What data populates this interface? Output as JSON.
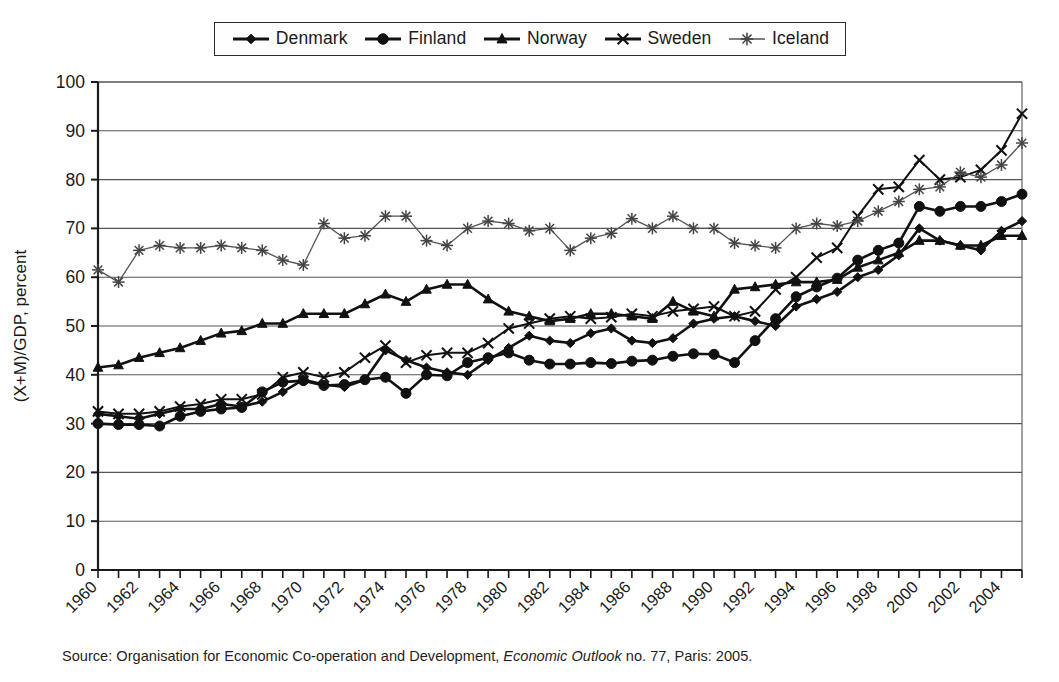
{
  "chart_data": {
    "type": "line",
    "title": "",
    "xlabel": "",
    "ylabel": "(X+M)/GDP, percent",
    "ylim": [
      0,
      100
    ],
    "ytick_step": 10,
    "yticks": [
      0,
      10,
      20,
      30,
      40,
      50,
      60,
      70,
      80,
      90,
      100
    ],
    "xlim": [
      1960,
      2005
    ],
    "xticks": [
      1960,
      1962,
      1964,
      1966,
      1968,
      1970,
      1972,
      1974,
      1976,
      1978,
      1980,
      1982,
      1984,
      1986,
      1988,
      1990,
      1992,
      1994,
      1996,
      1998,
      2000,
      2002,
      2004
    ],
    "xtick_labels": [
      "1960",
      "1962",
      "1964",
      "1966",
      "1968",
      "1970",
      "1972",
      "1974",
      "1976",
      "1978",
      "1980",
      "1982",
      "1984",
      "1986",
      "1988",
      "1990",
      "1992",
      "1994",
      "1996",
      "1998",
      "2000",
      "2002",
      "2004"
    ],
    "x": [
      1960,
      1961,
      1962,
      1963,
      1964,
      1965,
      1966,
      1967,
      1968,
      1969,
      1970,
      1971,
      1972,
      1973,
      1974,
      1975,
      1976,
      1977,
      1978,
      1979,
      1980,
      1981,
      1982,
      1983,
      1984,
      1985,
      1986,
      1987,
      1988,
      1989,
      1990,
      1991,
      1992,
      1993,
      1994,
      1995,
      1996,
      1997,
      1998,
      1999,
      2000,
      2001,
      2002,
      2003,
      2004,
      2005
    ],
    "grid": "horizontal",
    "legend_position": "top",
    "series": [
      {
        "name": "Denmark",
        "marker": "diamond",
        "values": [
          32.0,
          31.5,
          31.0,
          32.0,
          33.0,
          33.0,
          34.0,
          33.5,
          34.5,
          36.5,
          39.0,
          38.0,
          37.5,
          39.0,
          45.0,
          43.0,
          41.5,
          40.5,
          40.0,
          43.0,
          45.5,
          48.0,
          47.0,
          46.5,
          48.5,
          49.5,
          47.0,
          46.5,
          47.5,
          50.5,
          51.5,
          52.0,
          51.0,
          50.0,
          54.0,
          55.5,
          57.0,
          60.0,
          61.5,
          64.5,
          70.0,
          67.5,
          66.5,
          65.5,
          69.5,
          71.5
        ]
      },
      {
        "name": "Finland",
        "marker": "circle",
        "values": [
          30.0,
          29.8,
          29.8,
          29.5,
          31.5,
          32.5,
          33.0,
          33.3,
          36.5,
          38.5,
          38.8,
          37.8,
          38.0,
          39.0,
          39.5,
          36.2,
          40.0,
          39.8,
          42.5,
          43.5,
          44.5,
          43.0,
          42.2,
          42.2,
          42.5,
          42.3,
          42.8,
          43.0,
          43.8,
          44.3,
          44.2,
          42.5,
          47.0,
          51.5,
          56.0,
          58.0,
          59.8,
          63.5,
          65.5,
          67.0,
          74.5,
          73.5,
          74.5,
          74.5,
          75.5,
          77.0
        ]
      },
      {
        "name": "Norway",
        "marker": "triangle",
        "values": [
          41.5,
          42.0,
          43.5,
          44.5,
          45.5,
          47.0,
          48.5,
          49.0,
          50.5,
          50.5,
          52.5,
          52.5,
          52.5,
          54.5,
          56.5,
          55.0,
          57.5,
          58.5,
          58.5,
          55.5,
          53.0,
          52.0,
          51.0,
          51.5,
          52.5,
          52.5,
          52.0,
          51.5,
          55.0,
          53.0,
          52.0,
          57.5,
          58.0,
          58.5,
          59.0,
          59.0,
          59.5,
          62.0,
          63.5,
          65.0,
          67.5,
          67.5,
          66.5,
          66.5,
          68.5,
          68.5
        ]
      },
      {
        "name": "Sweden",
        "marker": "x",
        "values": [
          32.5,
          32.0,
          32.0,
          32.5,
          33.5,
          34.0,
          35.0,
          35.0,
          36.0,
          39.5,
          40.5,
          39.5,
          40.5,
          43.5,
          46.0,
          42.5,
          44.0,
          44.5,
          44.5,
          46.5,
          49.5,
          50.5,
          51.5,
          52.0,
          51.5,
          51.8,
          52.5,
          52.0,
          53.0,
          53.5,
          54.0,
          52.0,
          53.0,
          57.5,
          60.0,
          64.0,
          66.0,
          72.5,
          78.0,
          78.5,
          84.0,
          80.0,
          80.5,
          82.0,
          86.0,
          93.5
        ]
      },
      {
        "name": "Iceland",
        "marker": "asterisk",
        "values": [
          61.5,
          59.0,
          65.5,
          66.5,
          66.0,
          66.0,
          66.5,
          66.0,
          65.5,
          63.5,
          62.5,
          71.0,
          68.0,
          68.5,
          72.5,
          72.5,
          67.5,
          66.5,
          70.0,
          71.5,
          71.0,
          69.5,
          70.0,
          65.5,
          68.0,
          69.0,
          72.0,
          70.0,
          72.5,
          70.0,
          70.0,
          67.0,
          66.5,
          66.0,
          70.0,
          71.0,
          70.5,
          71.5,
          73.5,
          75.5,
          78.0,
          78.5,
          81.5,
          80.5,
          83.0,
          87.5
        ]
      }
    ]
  },
  "legend": {
    "entries": [
      {
        "label": "Denmark",
        "marker": "diamond"
      },
      {
        "label": "Finland",
        "marker": "circle"
      },
      {
        "label": "Norway",
        "marker": "triangle"
      },
      {
        "label": "Sweden",
        "marker": "x"
      },
      {
        "label": "Iceland",
        "marker": "asterisk"
      }
    ]
  },
  "axes": {
    "y_title": "(X+M)/GDP, percent"
  },
  "source": {
    "prefix": "Source: Organisation for Economic Co-operation and Development, ",
    "italic": "Economic Outlook",
    "suffix": " no. 77, Paris: 2005."
  }
}
